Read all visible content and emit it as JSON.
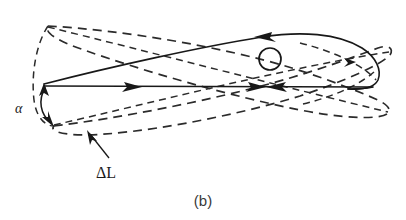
{
  "figure": {
    "caption": "(b)",
    "labels": {
      "angle": "α",
      "delta_length": "ΔL"
    },
    "icon_names": {
      "angle_arc": "angle-double-arrow-icon",
      "leader_arrow": "leader-arrow-icon",
      "flow_arrow": "direction-arrow-icon",
      "nucleus": "circle-marker-icon"
    },
    "colors": {
      "solid_stroke": "#181818",
      "dashed_stroke": "#2b2b2b",
      "background": "#ffffff",
      "caption": "#3a3a3a"
    },
    "geometry": {
      "apex": [
        44,
        84
      ],
      "chord_y": 87,
      "solid_tip_x": 380,
      "dashed_tip_x": 392,
      "circle_center": [
        270,
        59
      ],
      "circle_radius": 11,
      "angle_arc_start": [
        44,
        86
      ],
      "angle_arc_end": [
        51,
        124
      ],
      "leader_from": [
        108,
        160
      ],
      "leader_to": [
        88,
        133
      ]
    }
  }
}
